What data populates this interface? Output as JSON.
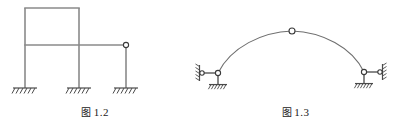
{
  "page": {
    "background_color": "#ffffff",
    "width": 401,
    "height": 130
  },
  "style": {
    "member_color": "#8a8a8a",
    "curve_color": "#6f6f6f",
    "hinge_stroke": "#3a3a3a",
    "hinge_fill": "#ffffff",
    "hatch_color": "#4a4a4a",
    "caption_color": "#1a1a1a"
  },
  "figures": [
    {
      "id": "figure-1-2",
      "caption_cjk": "图",
      "caption_number": "1.2",
      "caption_full": "图 1.2",
      "type": "rigid-frame-with-hinge",
      "description": "Plane frame: closed rectangular bay on the left with an extended beam to the right terminating at a hinge over a third column; all three column bases are fixed supports with ground hatching.",
      "members": [
        {
          "name": "left-column",
          "x1": 25,
          "y1": 8,
          "x2": 25,
          "y2": 88
        },
        {
          "name": "middle-column",
          "x1": 79,
          "y1": 8,
          "x2": 79,
          "y2": 88
        },
        {
          "name": "right-column",
          "x1": 126,
          "y1": 45,
          "x2": 126,
          "y2": 88
        },
        {
          "name": "top-beam",
          "x1": 25,
          "y1": 8,
          "x2": 79,
          "y2": 8
        },
        {
          "name": "lower-beam",
          "x1": 25,
          "y1": 45,
          "x2": 126,
          "y2": 45
        }
      ],
      "hinges": [
        {
          "name": "beam-end-hinge",
          "x": 126,
          "y": 45,
          "r": 2.6
        }
      ],
      "supports": [
        {
          "name": "fixed-support-left",
          "x": 25,
          "y": 88,
          "kind": "fixed"
        },
        {
          "name": "fixed-support-middle",
          "x": 79,
          "y": 88,
          "kind": "fixed"
        },
        {
          "name": "fixed-support-right",
          "x": 126,
          "y": 88,
          "kind": "fixed"
        }
      ]
    },
    {
      "id": "figure-1-3",
      "caption_cjk": "图",
      "caption_number": "1.3",
      "caption_full": "图 1.3",
      "type": "three-hinged-arch",
      "description": "Shallow curved arch rib with a hinge at the crown; each springing carries a pin that is restrained by a horizontal link to a vertical hatched wall and by a short vertical post seated on a hatched ground support.",
      "arch": {
        "name": "arch-rib",
        "left_springing": {
          "x": 28,
          "y": 73
        },
        "crown": {
          "x": 102,
          "y": 31
        },
        "right_springing": {
          "x": 174,
          "y": 72
        }
      },
      "hinges": [
        {
          "name": "crown-hinge",
          "x": 102,
          "y": 31,
          "r": 3.0
        },
        {
          "name": "left-springing-hinge",
          "x": 28,
          "y": 73,
          "r": 2.6
        },
        {
          "name": "right-springing-hinge",
          "x": 174,
          "y": 72,
          "r": 2.6
        },
        {
          "name": "left-link-pin",
          "x": 12,
          "y": 73,
          "r": 2.2
        },
        {
          "name": "right-link-pin",
          "x": 190,
          "y": 72,
          "r": 2.2
        }
      ],
      "supports": [
        {
          "name": "left-wall-support",
          "x": 10,
          "y": 73,
          "kind": "vertical-wall-hatch"
        },
        {
          "name": "left-ground-support",
          "x": 28,
          "y": 85,
          "kind": "ground-hatch"
        },
        {
          "name": "right-wall-support",
          "x": 192,
          "y": 72,
          "kind": "vertical-wall-hatch"
        },
        {
          "name": "right-ground-support",
          "x": 174,
          "y": 84,
          "kind": "ground-hatch"
        }
      ]
    }
  ]
}
